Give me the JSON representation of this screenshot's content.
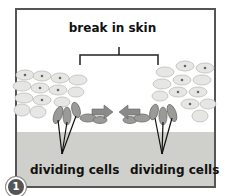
{
  "diagram": {
    "title_label": "break in skin",
    "left_label": "dividing cells",
    "right_label": "dividing cells",
    "step_number": "1",
    "colors": {
      "frame": "#555555",
      "dermis": "#cfcfcc",
      "epidermal_cells": "#e6e6e4",
      "dividing_cells": "#9a9a98",
      "arrows": "#8a8a88"
    }
  }
}
